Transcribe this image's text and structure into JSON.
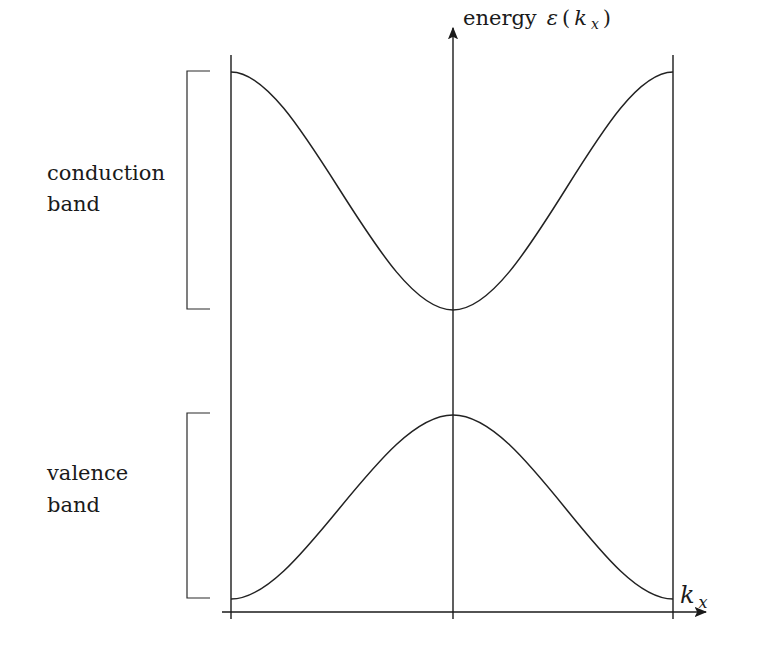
{
  "diagram": {
    "y_axis": {
      "label_prefix": "energy",
      "label_symbol": "ε",
      "label_open": "(",
      "label_var": "k",
      "label_sub": "x",
      "label_close": ")"
    },
    "x_axis": {
      "label_var": "k",
      "label_sub": "x"
    },
    "bands": [
      {
        "name": "conduction",
        "line1": "conduction",
        "line2": "band",
        "shape": "cosine, minimum at kx=0"
      },
      {
        "name": "valence",
        "line1": "valence",
        "line2": "band",
        "shape": "cosine, maximum at kx=0"
      }
    ],
    "colors": {
      "ink": "#1a1a1a",
      "background": "#ffffff"
    }
  }
}
